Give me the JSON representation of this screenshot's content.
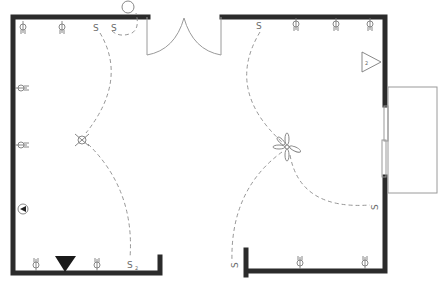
{
  "diagram": {
    "type": "electrical floor plan",
    "colors": {
      "wall": "#2b2b2b",
      "fixture": "#7a7a7a",
      "wire": "#8a8a8a",
      "background": "#ffffff"
    },
    "switch_symbol": "S",
    "switch_subscript": "2",
    "panel_label": "2",
    "elements": {
      "walls": [
        "left wall",
        "top-left wall",
        "top-right wall",
        "right wall upper",
        "right wall lower",
        "bottom-left wall",
        "bottom-right wall"
      ],
      "openings": [
        "double door (top)",
        "window (right)",
        "bay/bump-out (right)"
      ],
      "outlets_top": 5,
      "outlets_left": 2,
      "outlets_bottom": 4,
      "switches": 5,
      "ceiling_light": 1,
      "ceiling_fan": 1,
      "exterior_light": 1,
      "phone_jack": 1,
      "floor_outlet": 1,
      "panel": 1
    }
  }
}
